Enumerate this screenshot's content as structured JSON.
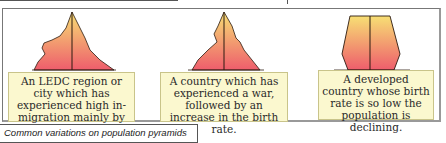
{
  "figure": {
    "caption": "Common variations on population pyramids",
    "panels": [
      {
        "shape": "pyramid-inmigration-young-men",
        "description": "An LEDC region or city which has experienced high in-migration mainly by young men."
      },
      {
        "shape": "pyramid-war-then-baby-boom",
        "description": "A country which has experienced a war, followed by an increase in the birth rate."
      },
      {
        "shape": "pyramid-declining-population",
        "description": "A developed country whose birth rate is so low the population is declining."
      }
    ],
    "colors": {
      "gradient_top": "#f7df74",
      "gradient_bottom": "#ee5d6c",
      "label_bg": "#fbf8cf",
      "outline": "#2b1a10"
    }
  }
}
